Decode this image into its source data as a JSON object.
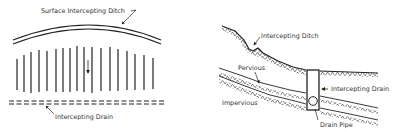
{
  "diagram": {
    "left_panel": {
      "view": "plan",
      "labels": {
        "surface_ditch": "Surface Intercepting Ditch",
        "intercepting_drain": "Intercepting Drain"
      }
    },
    "right_panel": {
      "view": "cross-section",
      "labels": {
        "intercepting_ditch": "Intercepting Ditch",
        "pervious": "Pervious",
        "impervious": "Impervious",
        "intercepting_drain": "Intercepting Drain",
        "drain_pipe": "Drain Pipe"
      }
    },
    "colors": {
      "ink": "#222222",
      "background": "#ffffff"
    }
  }
}
